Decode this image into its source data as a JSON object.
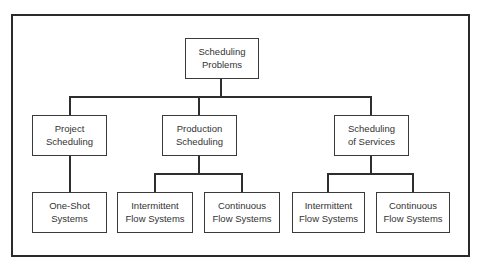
{
  "diagram": {
    "type": "hierarchy",
    "root": {
      "id": "root",
      "label_line1": "Scheduling",
      "label_line2": "Problems"
    },
    "level2": [
      {
        "id": "project",
        "label_line1": "Project",
        "label_line2": "Scheduling"
      },
      {
        "id": "production",
        "label_line1": "Production",
        "label_line2": "Scheduling"
      },
      {
        "id": "services",
        "label_line1": "Scheduling",
        "label_line2": "of Services"
      }
    ],
    "level3": [
      {
        "id": "one-shot",
        "parent": "project",
        "label_line1": "One-Shot",
        "label_line2": "Systems"
      },
      {
        "id": "prod-intermittent",
        "parent": "production",
        "label_line1": "Intermittent",
        "label_line2": "Flow Systems"
      },
      {
        "id": "prod-continuous",
        "parent": "production",
        "label_line1": "Continuous",
        "label_line2": "Flow Systems"
      },
      {
        "id": "serv-intermittent",
        "parent": "services",
        "label_line1": "Intermittent",
        "label_line2": "Flow Systems"
      },
      {
        "id": "serv-continuous",
        "parent": "services",
        "label_line1": "Continuous",
        "label_line2": "Flow Systems"
      }
    ],
    "colors": {
      "line": "#2e2e2e",
      "text": "#333333",
      "background": "#ffffff"
    }
  }
}
